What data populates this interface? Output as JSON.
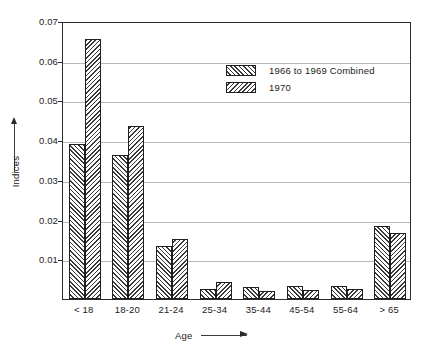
{
  "chart_data": {
    "type": "bar",
    "title": "",
    "xlabel": "Age",
    "ylabel": "Indices",
    "ylim": [
      0,
      0.07
    ],
    "yticks": [
      "0.01",
      "0.02",
      "0.03",
      "0.04",
      "0.05",
      "0.06",
      "0.07"
    ],
    "ytick_values": [
      0.01,
      0.02,
      0.03,
      0.04,
      0.05,
      0.06,
      0.07
    ],
    "grid": true,
    "legend_position": "upper-right-inset",
    "categories": [
      "< 18",
      "18-20",
      "21-24",
      "25-34",
      "35-44",
      "45-54",
      "55-64",
      "> 65"
    ],
    "series": [
      {
        "name": "1966 to 1969 Combined",
        "hatch": "forward-slash",
        "values": [
          0.039,
          0.0362,
          0.0133,
          0.0025,
          0.003,
          0.0033,
          0.0033,
          0.0185
        ]
      },
      {
        "name": "1970",
        "hatch": "back-slash",
        "values": [
          0.0655,
          0.0435,
          0.015,
          0.0043,
          0.002,
          0.0022,
          0.0025,
          0.0167
        ]
      }
    ]
  },
  "axes": {
    "y_title": "Indices",
    "x_title": "Age"
  }
}
